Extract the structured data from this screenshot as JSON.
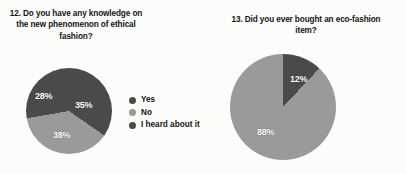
{
  "page": {
    "background_color": "#fcfcfb",
    "text_color": "#141414"
  },
  "palette": {
    "dark_gray": "#4a4a4a",
    "light_gray": "#9a9a9a",
    "label_text": "#ffffff"
  },
  "charts": [
    {
      "id": "chart-q12",
      "title": "12. Do you have any knowledge on the new phenomenon of ethical fashion?",
      "legend": [
        {
          "label": "Yes",
          "color": "#4a4a4a"
        },
        {
          "label": "No",
          "color": "#9a9a9a"
        },
        {
          "label": "I heard about it",
          "color": "#4a4a4a"
        }
      ],
      "labels": {
        "yes": "35%",
        "no": "38%",
        "heard": "28%"
      }
    },
    {
      "id": "chart-q13",
      "title": "13. Did you ever bought an eco-fashion item?",
      "legend": [
        {
          "label": "Yes",
          "color": "#4a4a4a"
        },
        {
          "label": "No",
          "color": "#9a9a9a"
        }
      ],
      "labels": {
        "yes": "12%",
        "no": "88%"
      }
    }
  ],
  "chart_data": [
    {
      "type": "pie",
      "title": "12. Do you have any knowledge on the new phenomenon of ethical fashion?",
      "categories": [
        "Yes",
        "No",
        "I heard about it"
      ],
      "values": [
        35,
        38,
        28
      ],
      "value_labels": [
        "35%",
        "38%",
        "28%"
      ],
      "colors": [
        "#4a4a4a",
        "#9a9a9a",
        "#4a4a4a"
      ],
      "units": "percent",
      "legend_position": "right",
      "start_angle_deg": 0,
      "direction": "clockwise",
      "grid": false
    },
    {
      "type": "pie",
      "title": "13. Did you ever bought an eco-fashion item?",
      "categories": [
        "Yes",
        "No"
      ],
      "values": [
        12,
        88
      ],
      "value_labels": [
        "12%",
        "88%"
      ],
      "colors": [
        "#4a4a4a",
        "#9a9a9a"
      ],
      "units": "percent",
      "legend_position": "right",
      "start_angle_deg": 0,
      "direction": "clockwise",
      "grid": false
    }
  ]
}
